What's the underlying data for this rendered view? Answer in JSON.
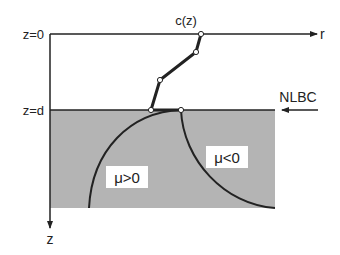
{
  "labels": {
    "z0": "z=0",
    "zd": "z=d",
    "r_axis": "r",
    "z_axis": "z",
    "cz": "c(z)",
    "nlbc": "NLBC",
    "mu_pos": "μ>0",
    "mu_neg": "μ<0"
  },
  "colors": {
    "line": "#222222",
    "shade": "#b4b4b4",
    "background": "#ffffff",
    "node_fill": "#ffffff"
  },
  "profile_points": [
    {
      "x": 201,
      "y": 34
    },
    {
      "x": 196,
      "y": 52
    },
    {
      "x": 160,
      "y": 80
    },
    {
      "x": 151,
      "y": 110
    },
    {
      "x": 181,
      "y": 110
    }
  ]
}
